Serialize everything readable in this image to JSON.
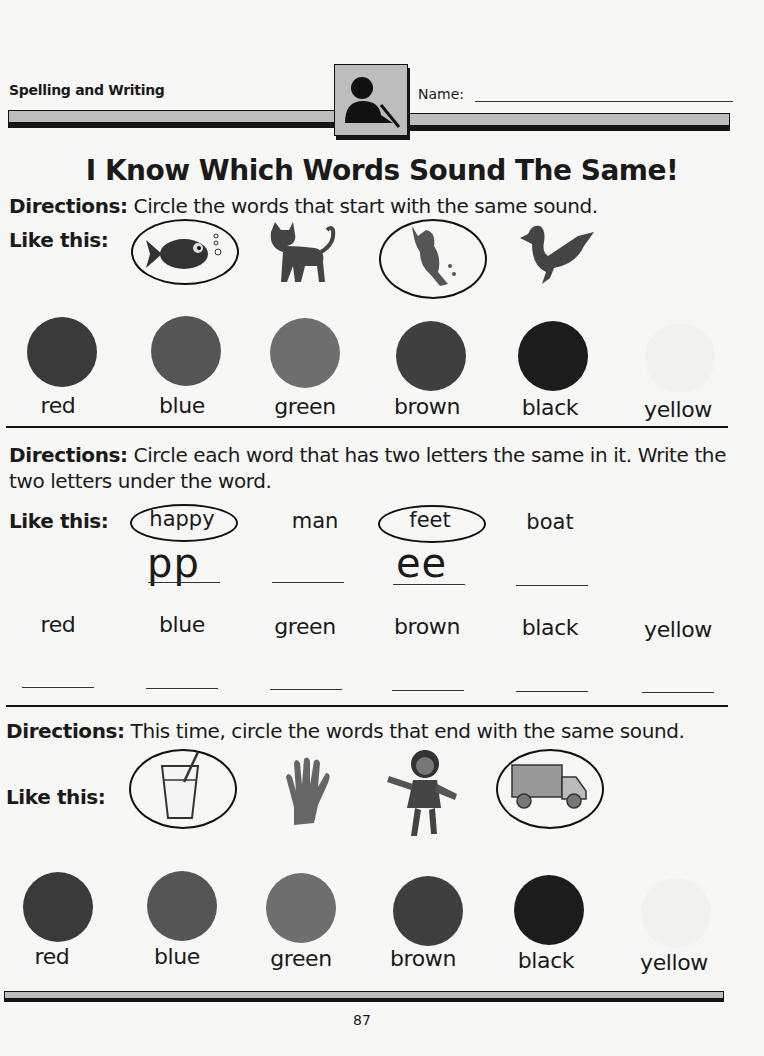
{
  "header": {
    "section_label": "Spelling and Writing",
    "name_label": "Name:",
    "logo_icon": "student-writing-icon"
  },
  "title": "I Know Which Words Sound The Same!",
  "section1": {
    "directions_label": "Directions:",
    "directions_text": "Circle the words that start with the same sound.",
    "like_this": "Like this:",
    "examples": [
      {
        "picture": "fish-icon",
        "circled": true
      },
      {
        "picture": "cat-icon",
        "circled": false
      },
      {
        "picture": "frog-icon",
        "circled": true
      },
      {
        "picture": "bird-icon",
        "circled": false
      }
    ],
    "colors": [
      {
        "word": "red",
        "hex": "#3a3a3a"
      },
      {
        "word": "blue",
        "hex": "#555555"
      },
      {
        "word": "green",
        "hex": "#6e6e6e"
      },
      {
        "word": "brown",
        "hex": "#3f3f3f"
      },
      {
        "word": "black",
        "hex": "#1c1c1c"
      },
      {
        "word": "yellow",
        "hex": "#f2f2f0"
      }
    ]
  },
  "section2": {
    "directions_label": "Directions:",
    "directions_text": "Circle each word that has two letters the same in it. Write the two letters under the word.",
    "like_this": "Like this:",
    "examples": [
      {
        "word": "happy",
        "circled": true,
        "answer": "pp"
      },
      {
        "word": "man",
        "circled": false,
        "answer": ""
      },
      {
        "word": "feet",
        "circled": true,
        "answer": "ee"
      },
      {
        "word": "boat",
        "circled": false,
        "answer": ""
      }
    ],
    "words": [
      "red",
      "blue",
      "green",
      "brown",
      "black",
      "yellow"
    ]
  },
  "section3": {
    "directions_label": "Directions:",
    "directions_text": "This time, circle the words that end with the same sound.",
    "like_this": "Like this:",
    "examples": [
      {
        "picture": "glass-of-milk-icon",
        "circled": true
      },
      {
        "picture": "glove-icon",
        "circled": false
      },
      {
        "picture": "doll-icon",
        "circled": false
      },
      {
        "picture": "truck-icon",
        "circled": true
      }
    ],
    "colors": [
      {
        "word": "red",
        "hex": "#3a3a3a"
      },
      {
        "word": "blue",
        "hex": "#555555"
      },
      {
        "word": "green",
        "hex": "#6e6e6e"
      },
      {
        "word": "brown",
        "hex": "#3f3f3f"
      },
      {
        "word": "black",
        "hex": "#1c1c1c"
      },
      {
        "word": "yellow",
        "hex": "#f2f2f0"
      }
    ]
  },
  "footer": {
    "page_number": "87"
  }
}
